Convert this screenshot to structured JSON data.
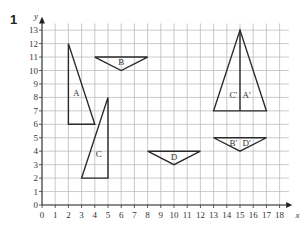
{
  "question": {
    "number": "1",
    "header_partial": ". . . . . . . g . . p . ."
  },
  "diagram": {
    "x_axis_label": "x",
    "y_axis_label": "y",
    "x_ticks": [
      "0",
      "1",
      "2",
      "3",
      "4",
      "5",
      "6",
      "7",
      "8",
      "9",
      "10",
      "11",
      "12",
      "13",
      "14",
      "15",
      "16",
      "17",
      "18"
    ],
    "y_ticks": [
      "0",
      "1",
      "2",
      "3",
      "4",
      "5",
      "6",
      "7",
      "8",
      "9",
      "10",
      "11",
      "12",
      "13"
    ],
    "x_range": [
      0,
      18
    ],
    "y_range": [
      0,
      13
    ],
    "grid": true,
    "shapes": [
      {
        "label": "A",
        "vertices": [
          [
            2,
            12
          ],
          [
            2,
            6
          ],
          [
            4,
            6
          ]
        ],
        "label_pos": [
          2.6,
          8.3
        ]
      },
      {
        "label": "B",
        "vertices": [
          [
            4,
            11
          ],
          [
            8,
            11
          ],
          [
            6,
            10
          ]
        ],
        "label_pos": [
          6,
          10.6
        ]
      },
      {
        "label": "C",
        "vertices": [
          [
            3,
            2
          ],
          [
            5,
            2
          ],
          [
            5,
            8
          ]
        ],
        "label_pos": [
          4.3,
          3.8
        ]
      },
      {
        "label": "D",
        "vertices": [
          [
            8,
            4
          ],
          [
            12,
            4
          ],
          [
            10,
            3
          ]
        ],
        "label_pos": [
          10,
          3.6
        ]
      },
      {
        "label": "C' A'",
        "vertices": [
          [
            13,
            7
          ],
          [
            17,
            7
          ],
          [
            15,
            13
          ]
        ],
        "divider": [
          [
            15,
            7
          ],
          [
            15,
            13
          ]
        ],
        "label_pos_left": [
          14.5,
          8.2
        ],
        "label_pos_right": [
          15.5,
          8.2
        ],
        "left_label": "C'",
        "right_label": "A'"
      },
      {
        "label": "B' D'",
        "vertices": [
          [
            13,
            5
          ],
          [
            17,
            5
          ],
          [
            15,
            4
          ]
        ],
        "label_pos_left": [
          14.5,
          4.6
        ],
        "label_pos_right": [
          15.5,
          4.6
        ],
        "left_label": "B'",
        "right_label": "D'"
      }
    ]
  }
}
